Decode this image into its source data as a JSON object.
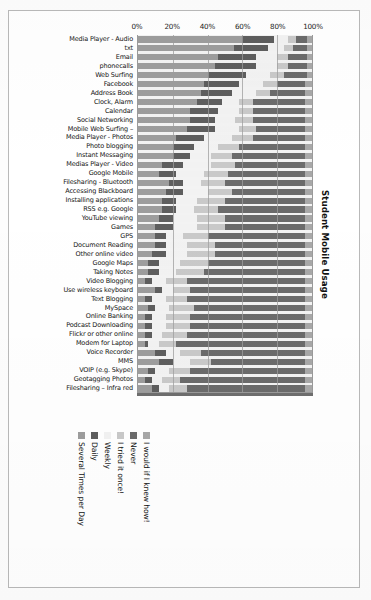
{
  "page": {
    "side_title": "Student Mobile Usage"
  },
  "chart_data": {
    "type": "bar",
    "orientation": "horizontal",
    "stacked": "100%",
    "title": "Student Mobile Usage",
    "xlabel": "",
    "ylabel": "",
    "xlim": [
      0,
      100
    ],
    "xticks": [
      "0%",
      "20%",
      "40%",
      "60%",
      "80%",
      "100%"
    ],
    "xtick_values": [
      0,
      20,
      40,
      60,
      80,
      100
    ],
    "grid": true,
    "legend_position": "bottom-rotated",
    "colors": {
      "several_times_per_day": "#9d9d9d",
      "daily": "#5e5e5e",
      "weekly": "#f2f2f2",
      "i_tried_it_once": "#c9c9c9",
      "never": "#6b6b6b",
      "i_would_if_i_knew_how": "#a8a8a8"
    },
    "series": [
      {
        "name": "Several Times per Day",
        "color": "#9d9d9d"
      },
      {
        "name": "Daily",
        "color": "#5e5e5e"
      },
      {
        "name": "Weekly",
        "color": "#f2f2f2"
      },
      {
        "name": "I tried it once!",
        "color": "#c9c9c9"
      },
      {
        "name": "Never",
        "color": "#6b6b6b"
      },
      {
        "name": "I would if I knew how!",
        "color": "#a8a8a8"
      }
    ],
    "categories": [
      "Media Player - Audio",
      "txt",
      "Email",
      "phonecalls",
      "Web Surfing",
      "Facebook",
      "Address Book",
      "Clock, Alarm",
      "Calendar",
      "Social Networking",
      "Mobile Web Surfing –",
      "Media Player - Photos",
      "Photo blogging",
      "Instant Messaging",
      "Medias Player - Video",
      "Google Mobile",
      "Filesharing - Bluetooth",
      "Accessing Blackboard",
      "Installing applications",
      "RSS e.g. Google",
      "YouTube viewing",
      "Games",
      "GPS",
      "Document Reading",
      "Other online video",
      "Google Maps",
      "Taking Notes",
      "Video Blogging",
      "Use wireless keyboard",
      "Text Blogging",
      "MySpace",
      "Online Banking",
      "Podcast Downloading",
      "Flickr or other online",
      "Modem for Laptop",
      "Voice Recorder",
      "MMS",
      "VOIP (e.g. Skype)",
      "Geotagging Photos",
      "Filesharing – Infra red"
    ],
    "values": [
      [
        60,
        18,
        8,
        5,
        6,
        3
      ],
      [
        55,
        20,
        9,
        5,
        8,
        3
      ],
      [
        46,
        22,
        12,
        6,
        11,
        3
      ],
      [
        44,
        24,
        12,
        6,
        11,
        3
      ],
      [
        40,
        22,
        14,
        8,
        13,
        3
      ],
      [
        38,
        20,
        14,
        8,
        16,
        4
      ],
      [
        36,
        18,
        14,
        8,
        20,
        4
      ],
      [
        34,
        14,
        10,
        8,
        30,
        4
      ],
      [
        30,
        16,
        12,
        8,
        30,
        4
      ],
      [
        30,
        14,
        12,
        10,
        30,
        4
      ],
      [
        28,
        16,
        14,
        10,
        28,
        4
      ],
      [
        22,
        16,
        16,
        12,
        30,
        4
      ],
      [
        20,
        12,
        14,
        12,
        38,
        4
      ],
      [
        20,
        10,
        12,
        12,
        42,
        4
      ],
      [
        14,
        12,
        16,
        14,
        40,
        4
      ],
      [
        12,
        10,
        16,
        14,
        44,
        4
      ],
      [
        18,
        8,
        10,
        14,
        46,
        4
      ],
      [
        16,
        10,
        14,
        14,
        42,
        4
      ],
      [
        14,
        8,
        12,
        16,
        46,
        4
      ],
      [
        14,
        8,
        10,
        14,
        50,
        4
      ],
      [
        12,
        8,
        14,
        16,
        46,
        4
      ],
      [
        10,
        10,
        14,
        16,
        46,
        4
      ],
      [
        10,
        6,
        10,
        14,
        56,
        4
      ],
      [
        10,
        6,
        12,
        16,
        52,
        4
      ],
      [
        8,
        8,
        12,
        16,
        52,
        4
      ],
      [
        6,
        6,
        12,
        16,
        56,
        4
      ],
      [
        6,
        6,
        10,
        16,
        58,
        4
      ],
      [
        4,
        4,
        8,
        12,
        68,
        4
      ],
      [
        10,
        4,
        6,
        10,
        66,
        4
      ],
      [
        4,
        4,
        8,
        12,
        68,
        4
      ],
      [
        6,
        4,
        8,
        14,
        64,
        4
      ],
      [
        4,
        4,
        8,
        14,
        66,
        4
      ],
      [
        4,
        4,
        8,
        14,
        66,
        4
      ],
      [
        4,
        4,
        6,
        14,
        68,
        4
      ],
      [
        4,
        2,
        6,
        10,
        74,
        4
      ],
      [
        10,
        6,
        8,
        12,
        60,
        4
      ],
      [
        12,
        8,
        10,
        12,
        54,
        4
      ],
      [
        6,
        4,
        8,
        12,
        66,
        4
      ],
      [
        4,
        4,
        6,
        10,
        72,
        4
      ],
      [
        8,
        4,
        6,
        10,
        68,
        4
      ]
    ]
  }
}
